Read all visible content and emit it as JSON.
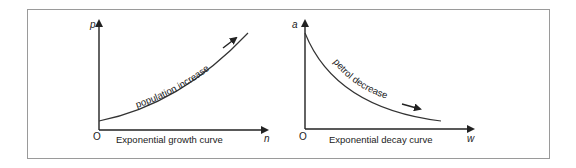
{
  "diagrams": [
    {
      "name": "growth",
      "y_axis_label": "p",
      "x_axis_label": "n",
      "origin_label": "O",
      "caption": "Exponential growth curve",
      "curve_label": "population increase"
    },
    {
      "name": "decay",
      "y_axis_label": "a",
      "x_axis_label": "w",
      "origin_label": "O",
      "caption": "Exponential decay curve",
      "curve_label": "petrol decrease"
    }
  ],
  "colors": {
    "line": "#222222",
    "border": "#9a9a9a",
    "background": "#ffffff"
  }
}
